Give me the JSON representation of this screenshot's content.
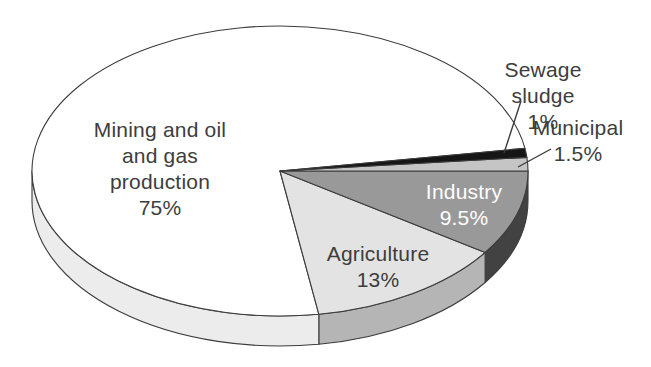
{
  "chart_data": {
    "type": "pie",
    "title": "",
    "legend": "none",
    "style": "3d-pie, grayscale, white background, thin dark outlines",
    "categories": [
      "Sewage sludge",
      "Municipal",
      "Industry",
      "Agriculture",
      "Mining and oil and gas production"
    ],
    "values": [
      1,
      1.5,
      9.5,
      13,
      75
    ],
    "unit": "%",
    "slices": [
      {
        "id": "sewage-sludge",
        "label": "Sewage sludge",
        "pct_label": "1%",
        "value": 1,
        "label_text": "Sewage sludge\n1%",
        "top_color": "#161616",
        "side_color": "#161616",
        "label_color": "#3d3d3d",
        "label_x": 543,
        "label_y": 57
      },
      {
        "id": "municipal",
        "label": "Municipal",
        "pct_label": "1.5%",
        "value": 1.5,
        "label_text": "Municipal\n1.5%",
        "top_color": "#c5c5c5",
        "side_color": "#9a9a9a",
        "label_color": "#3d3d3d",
        "label_x": 578,
        "label_y": 115
      },
      {
        "id": "industry",
        "label": "Industry",
        "pct_label": "9.5%",
        "value": 9.5,
        "label_text": "Industry\n9.5%",
        "top_color": "#999999",
        "side_color": "#424242",
        "label_color": "#ffffff",
        "label_x": 464,
        "label_y": 179
      },
      {
        "id": "agriculture",
        "label": "Agriculture",
        "pct_label": "13%",
        "value": 13,
        "label_text": "Agriculture\n13%",
        "top_color": "#e3e3e3",
        "side_color": "#b5b5b5",
        "label_color": "#3d3d3d",
        "label_x": 378,
        "label_y": 241
      },
      {
        "id": "mining-oil-gas",
        "label": "Mining and oil and gas production",
        "pct_label": "75%",
        "value": 75,
        "label_text": "Mining and oil\nand gas\nproduction\n75%",
        "top_color": "#ffffff",
        "side_color": "#ececec",
        "label_color": "#3d3d3d",
        "label_x": 160,
        "label_y": 117
      }
    ],
    "leader_lines": [
      {
        "for": "sewage-sludge",
        "x1": 521,
        "y1": 101,
        "x2": 504,
        "y2": 153
      },
      {
        "for": "municipal",
        "x1": 551,
        "y1": 149,
        "x2": 518,
        "y2": 167
      }
    ],
    "layout": {
      "cx": 280,
      "cy": 171,
      "rx": 248,
      "ry": 145,
      "depth": 30,
      "start_angle_deg": 9,
      "direction": "clockwise",
      "outline_color": "#3c3c3c",
      "background": "#ffffff"
    }
  }
}
